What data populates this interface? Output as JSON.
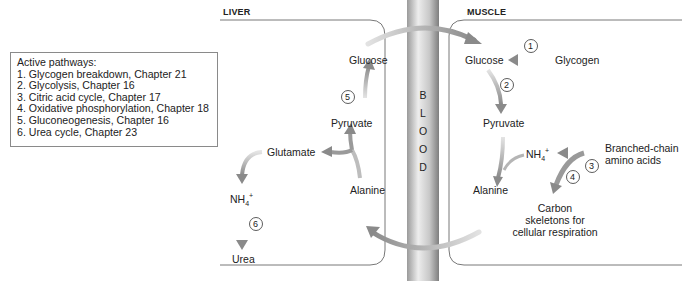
{
  "legend": {
    "title": "Active pathways:",
    "items": [
      "1.  Glycogen breakdown, Chapter 21",
      "2.  Glycolysis, Chapter 16",
      "3.  Citric acid cycle, Chapter 17",
      "4.  Oxidative phosphorylation, Chapter 18",
      "5.  Gluconeogenesis, Chapter 16",
      "6.  Urea cycle, Chapter 23"
    ]
  },
  "liver": {
    "title": "LIVER",
    "glucose": "Glucose",
    "pyruvate": "Pyruvate",
    "glutamate": "Glutamate",
    "alanine": "Alanine",
    "nh4": "NH",
    "nh4_sub": "4",
    "nh4_sup": "+",
    "urea": "Urea",
    "step_5": "5",
    "step_6": "6"
  },
  "blood": {
    "letters": [
      "B",
      "L",
      "O",
      "O",
      "D"
    ]
  },
  "muscle": {
    "title": "MUSCLE",
    "glucose": "Glucose",
    "glycogen": "Glycogen",
    "pyruvate": "Pyruvate",
    "alanine": "Alanine",
    "nh4": "NH",
    "nh4_sub": "4",
    "nh4_sup": "+",
    "bcaa_line1": "Branched-chain",
    "bcaa_line2": "amino acids",
    "carbon_line1": "Carbon",
    "carbon_line2": "skeletons for",
    "carbon_line3": "cellular respiration",
    "step_1": "1",
    "step_2": "2",
    "step_3": "3",
    "step_4": "4"
  },
  "colors": {
    "arrow": "#8c8c8c",
    "arrow_light": "#d9d9d9",
    "vessel_dark": "#8a8a8a",
    "vessel_light": "#e8e8e8",
    "border": "#555555"
  }
}
